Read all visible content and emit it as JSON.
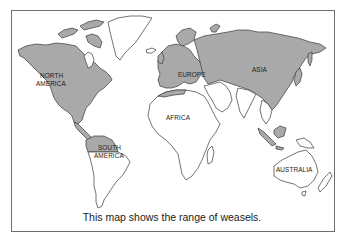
{
  "map": {
    "caption": "This map shows the range of weasels.",
    "legend_colors": {
      "range": "#a9a9a9",
      "no_range": "#ffffff",
      "outline": "#3a3a3a"
    },
    "labels": {
      "north_america": [
        "NORTH",
        "AMERICA"
      ],
      "south_america": [
        "SOUTH",
        "AMERICA"
      ],
      "europe": "EUROPE",
      "asia": "ASIA",
      "africa": "AFRICA",
      "australia": "AUSTRALIA"
    },
    "regions": [
      {
        "name": "North America",
        "in_range": true
      },
      {
        "name": "Greenland",
        "in_range": false
      },
      {
        "name": "Central America",
        "in_range": true
      },
      {
        "name": "Northern South America",
        "in_range": true
      },
      {
        "name": "Southern South America",
        "in_range": false
      },
      {
        "name": "Europe",
        "in_range": true
      },
      {
        "name": "Asia",
        "in_range": true
      },
      {
        "name": "Middle East / Southwest Asia",
        "in_range": false
      },
      {
        "name": "India",
        "in_range": false
      },
      {
        "name": "Africa",
        "in_range": true,
        "note": "northern coast only"
      },
      {
        "name": "Southeast Asian islands",
        "in_range": true
      },
      {
        "name": "Australia",
        "in_range": false
      },
      {
        "name": "New Zealand",
        "in_range": false
      }
    ]
  }
}
